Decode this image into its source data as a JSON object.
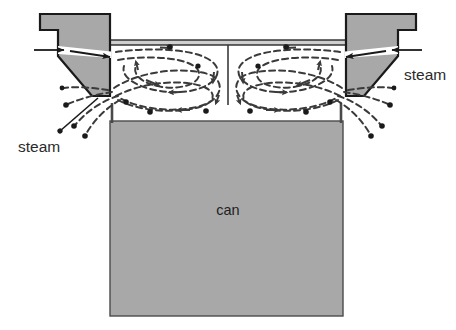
{
  "figure": {
    "type": "technical-cross-section-diagram"
  },
  "colors": {
    "metal_fill": "#a8a8a8",
    "can_fill": "#a8a8a8",
    "outline": "#1a1a1a",
    "slit_fill": "#ffffff",
    "background": "#ffffff",
    "flow_line": "#3a3a3a",
    "label_color": "#2b2b2b"
  },
  "labels": {
    "steam_right": "steam",
    "steam_left": "steam",
    "can": "can"
  },
  "parts": {
    "left_nozzle": {
      "name": "left steam nozzle block",
      "points": "40,14 110,14 110,96 92,96 58,56 58,30 40,30"
    },
    "right_nozzle": {
      "name": "right steam nozzle block",
      "points": "416,14 346,14 346,96 364,96 398,56 398,30 416,30"
    },
    "left_slit": {
      "name": "left nozzle steam slit",
      "points": "58,47 110,52 110,57 58,53"
    },
    "right_slit": {
      "name": "right nozzle steam slit",
      "points": "398,47 346,52 346,57 398,53"
    },
    "top_plate": {
      "name": "horizontal top plate",
      "x": 110,
      "y": 40,
      "width": 236,
      "height": 5
    },
    "center_divider": {
      "name": "center vertical divider",
      "x1": 228,
      "y1": 45,
      "x2": 228,
      "y2": 105
    },
    "can_body": {
      "name": "can body",
      "x": 110,
      "y": 103,
      "width": 233,
      "height": 213,
      "fill_top_y": 121
    },
    "can_left_wall": {
      "x1": 112,
      "y1": 103,
      "x2": 112,
      "y2": 123
    },
    "can_right_wall": {
      "x1": 341,
      "y1": 103,
      "x2": 341,
      "y2": 123
    }
  },
  "arrows": {
    "inlet_left_outer": {
      "x1": 36,
      "y1": 50,
      "x2": 66,
      "y2": 50
    },
    "inlet_left_inner": {
      "x1": 72,
      "y1": 51,
      "x2": 112,
      "y2": 57
    },
    "inlet_right_outer": {
      "x1": 420,
      "y1": 50,
      "x2": 390,
      "y2": 50
    },
    "inlet_right_inner": {
      "x1": 384,
      "y1": 51,
      "x2": 344,
      "y2": 57
    }
  },
  "leaders": {
    "steam_left_leader": {
      "x1": 62,
      "y1": 129,
      "x2": 96,
      "y2": 99
    },
    "steam_right_leader": {
      "x1": 394,
      "y1": 129,
      "x2": 360,
      "y2": 99
    }
  },
  "flow": {
    "description": "Dashed recirculating vortex streamlines inside the chamber with escaping steam plumes at both lower outer corners",
    "left_chamber_rotation": "clockwise",
    "right_chamber_rotation": "counter-clockwise",
    "dash_pattern": "6 4",
    "loop_count_per_chamber": 3,
    "plume_count_per_side": 4
  }
}
